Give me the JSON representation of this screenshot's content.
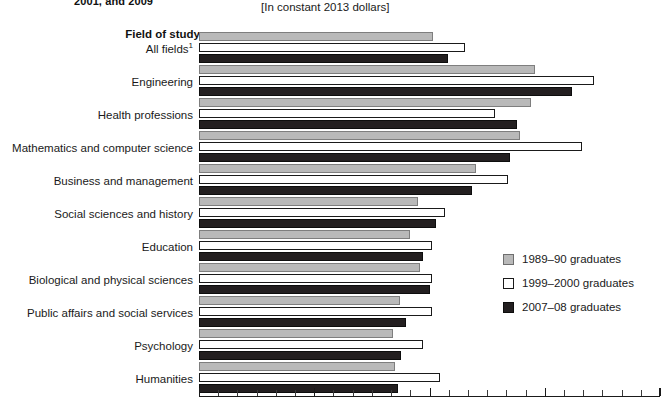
{
  "header": {
    "title_visible": "2001, and 2009",
    "subtitle": "[In constant 2013 dollars]",
    "axis_title": "Field of study"
  },
  "legend": {
    "position": "right-middle",
    "items": [
      {
        "label": "1989–90 graduates",
        "color": "#b9b9b9",
        "series_key": "1989-90"
      },
      {
        "label": "1999–2000 graduates",
        "color": "#ffffff",
        "series_key": "1999-2000"
      },
      {
        "label": "2007–08 graduates",
        "color": "#231f20",
        "series_key": "2007-08"
      }
    ]
  },
  "chart_data": {
    "type": "bar",
    "orientation": "horizontal",
    "title": "2001, and 2009",
    "subtitle": "[In constant 2013 dollars]",
    "xlabel": "",
    "ylabel": "Field of study",
    "grid": false,
    "legend_position": "right",
    "axis_start_px": 199,
    "axis_end_px": 660,
    "categories": [
      "All fields",
      "Engineering",
      "Health professions",
      "Mathematics and computer science",
      "Business and management",
      "Social sciences and history",
      "Education",
      "Biological and physical sciences",
      "Public affairs and social services",
      "Psychology",
      "Humanities"
    ],
    "category_footnotes": {
      "All fields": "1"
    },
    "series": [
      {
        "name": "1989–90 graduates",
        "color": "#b9b9b9",
        "values": [
          234,
          336,
          332,
          321,
          277,
          219,
          211,
          221,
          201,
          194,
          196
        ]
      },
      {
        "name": "1999–2000 graduates",
        "color": "#ffffff",
        "values": [
          266,
          395,
          296,
          383,
          309,
          246,
          233,
          233,
          233,
          224,
          241
        ]
      },
      {
        "name": "2007–08 graduates",
        "color": "#231f20",
        "values": [
          249,
          373,
          318,
          311,
          273,
          237,
          224,
          231,
          207,
          202,
          199
        ]
      }
    ],
    "xlim": [
      0,
      461
    ],
    "tick_count": 24
  }
}
